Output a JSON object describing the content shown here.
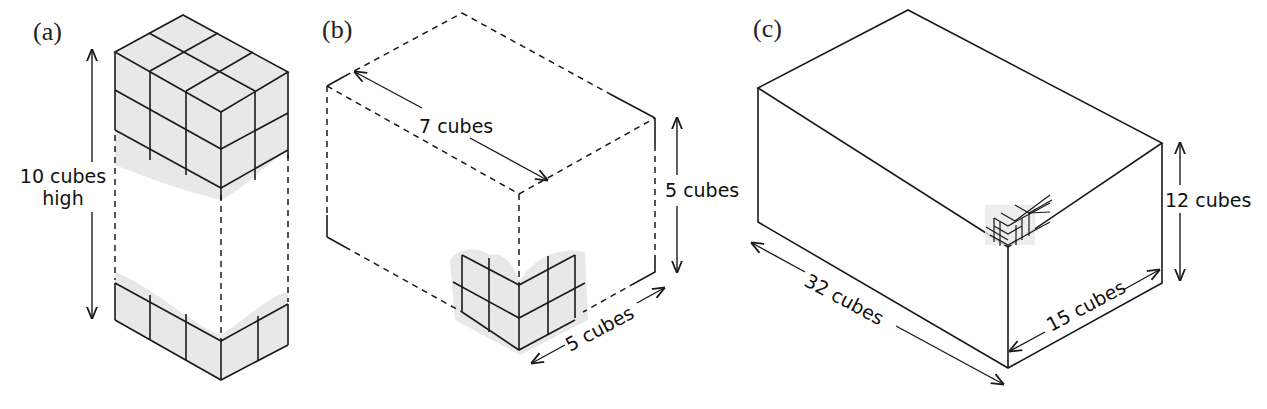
{
  "figure": {
    "panels": [
      {
        "id": "a",
        "label": "(a)",
        "dimension_labels": {
          "height_line1": "10 cubes",
          "height_line2": "high"
        }
      },
      {
        "id": "b",
        "label": "(b)",
        "dimension_labels": {
          "length": "7 cubes",
          "height": "5 cubes",
          "width": "5 cubes"
        }
      },
      {
        "id": "c",
        "label": "(c)",
        "dimension_labels": {
          "length": "32 cubes",
          "height": "12 cubes",
          "width": "15 cubes"
        }
      }
    ],
    "colors": {
      "line": "#1a1a1a",
      "shade": "#e8e8e8",
      "background": "#ffffff"
    }
  }
}
